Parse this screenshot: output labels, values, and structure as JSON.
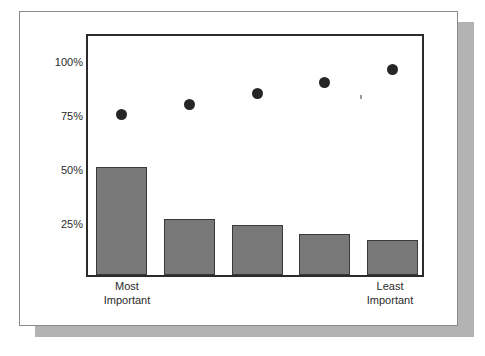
{
  "chart_data": {
    "type": "bar",
    "title": "",
    "subtitle": "",
    "xlabel": "",
    "ylabel": "",
    "categories": [
      "Most Important",
      "",
      "",
      "",
      "Least Important"
    ],
    "ytick_labels": [
      "100%",
      "75%",
      "50%",
      "25%"
    ],
    "ytick_values": [
      100,
      75,
      50,
      25
    ],
    "ylim": [
      0,
      112.5
    ],
    "grid": false,
    "legend": null,
    "series": [
      {
        "name": "Percent selecting rank",
        "type": "bar",
        "values": [
          50,
          26,
          23,
          19,
          16
        ],
        "color": "#787878",
        "edge_color": "#3a3a3a"
      },
      {
        "name": "Cumulative percent",
        "type": "scatter",
        "values": [
          76,
          81,
          86,
          91,
          97
        ],
        "color": "#262626",
        "marker": "circle"
      }
    ]
  },
  "axis": {
    "ticks": [
      {
        "label": "100%",
        "value": 100
      },
      {
        "label": "75%",
        "value": 75
      },
      {
        "label": "50%",
        "value": 50
      },
      {
        "label": "25%",
        "value": 25
      }
    ],
    "x_left_label_line1": "Most",
    "x_left_label_line2": "Important",
    "x_right_label_line1": "Least",
    "x_right_label_line2": "Important"
  },
  "colors": {
    "bar_fill": "#787878",
    "bar_edge": "#3a3a3a",
    "dot_fill": "#262626",
    "frame": "#2b2b2b",
    "card_border": "#8a8a8a",
    "shadow": "#b3b3b3",
    "background": "#ffffff",
    "text": "#2b2b2b"
  }
}
